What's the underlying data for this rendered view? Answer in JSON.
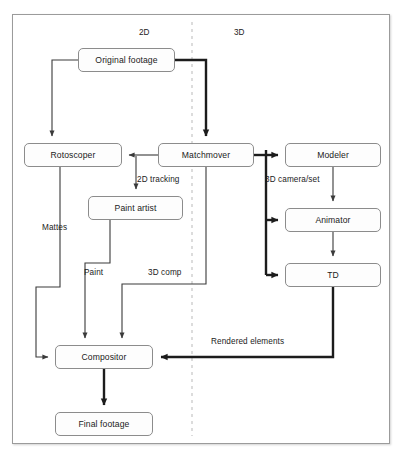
{
  "diagram": {
    "regions": [
      {
        "label": "2D",
        "x": 139,
        "y": 28
      },
      {
        "label": "3D",
        "x": 234,
        "y": 28
      }
    ],
    "divider": {
      "x": 192,
      "y1": 22,
      "y2": 436,
      "style": "dashed",
      "color": "#b9b9b9"
    },
    "nodes": [
      {
        "id": "original-footage",
        "label": "Original footage",
        "x": 78,
        "y": 48,
        "w": 97,
        "h": 24
      },
      {
        "id": "rotoscoper",
        "label": "Rotoscoper",
        "x": 24,
        "y": 143,
        "w": 98,
        "h": 24
      },
      {
        "id": "matchmover",
        "label": "Matchmover",
        "x": 158,
        "y": 143,
        "w": 96,
        "h": 24
      },
      {
        "id": "modeler",
        "label": "Modeler",
        "x": 285,
        "y": 143,
        "w": 96,
        "h": 24
      },
      {
        "id": "paint-artist",
        "label": "Paint artist",
        "x": 88,
        "y": 196,
        "w": 95,
        "h": 24
      },
      {
        "id": "animator",
        "label": "Animator",
        "x": 285,
        "y": 208,
        "w": 96,
        "h": 24
      },
      {
        "id": "td",
        "label": "TD",
        "x": 285,
        "y": 263,
        "w": 96,
        "h": 24
      },
      {
        "id": "compositor",
        "label": "Compositor",
        "x": 55,
        "y": 345,
        "w": 98,
        "h": 24
      },
      {
        "id": "final-footage",
        "label": "Final footage",
        "x": 55,
        "y": 412,
        "w": 98,
        "h": 24
      }
    ],
    "edge_labels": [
      {
        "id": "2d-tracking",
        "label": "2D tracking",
        "x": 137,
        "y": 175
      },
      {
        "id": "3d-camera-set",
        "label": "3D camera/set",
        "x": 265,
        "y": 175
      },
      {
        "id": "mattes",
        "label": "Mattes",
        "x": 42,
        "y": 223
      },
      {
        "id": "paint",
        "label": "Paint",
        "x": 84,
        "y": 268
      },
      {
        "id": "3d-comp",
        "label": "3D comp",
        "x": 148,
        "y": 268
      },
      {
        "id": "rendered-elements",
        "label": "Rendered elements",
        "x": 211,
        "y": 337
      }
    ],
    "colors": {
      "stroke_thin": "#3a3a3a",
      "stroke_thick": "#1c1c1c",
      "node_border": "#8c8c8c",
      "frame_border": "#9b9b9b",
      "divider": "#b9b9b9",
      "text": "#1b1b1b",
      "background": "#ffffff"
    },
    "edges": [
      {
        "from": "original-footage",
        "to": "rotoscoper",
        "weight": "thin"
      },
      {
        "from": "original-footage",
        "to": "matchmover",
        "weight": "thick"
      },
      {
        "from": "matchmover",
        "to": "rotoscoper",
        "weight": "thin"
      },
      {
        "from": "matchmover",
        "to": "paint-artist",
        "weight": "thin",
        "label": "2D tracking"
      },
      {
        "from": "matchmover",
        "to": "modeler",
        "weight": "thick"
      },
      {
        "from": "matchmover",
        "to": "animator",
        "weight": "thick"
      },
      {
        "from": "matchmover",
        "to": "td",
        "weight": "thick"
      },
      {
        "from": "matchmover",
        "to": "compositor",
        "weight": "thin",
        "label": "3D comp"
      },
      {
        "from": "modeler",
        "to": "animator",
        "weight": "thin",
        "label": "3D camera/set"
      },
      {
        "from": "animator",
        "to": "td",
        "weight": "thin"
      },
      {
        "from": "td",
        "to": "compositor",
        "weight": "thick",
        "label": "Rendered elements"
      },
      {
        "from": "rotoscoper",
        "to": "compositor",
        "weight": "thin",
        "label": "Mattes"
      },
      {
        "from": "paint-artist",
        "to": "compositor",
        "weight": "thin",
        "label": "Paint"
      },
      {
        "from": "compositor",
        "to": "final-footage",
        "weight": "thick"
      }
    ]
  }
}
